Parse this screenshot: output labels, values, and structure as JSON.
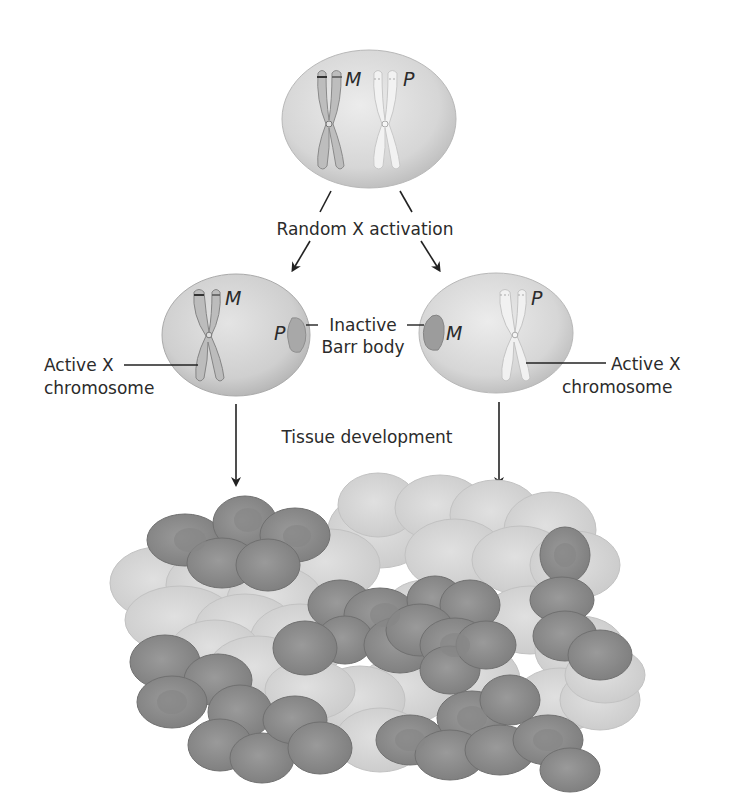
{
  "diagram": {
    "title_step1": "Random X activation",
    "title_step2": "Tissue development",
    "top_cell": {
      "chromosome_maternal": "M",
      "chromosome_paternal": "P"
    },
    "left_cell": {
      "active_label": "M",
      "barr_label": "P",
      "active_callout_line1": "Active X",
      "active_callout_line2": "chromosome"
    },
    "right_cell": {
      "active_label": "P",
      "barr_label": "M",
      "active_callout_line1": "Active X",
      "active_callout_line2": "chromosome"
    },
    "barr_callout_line1": "Inactive",
    "barr_callout_line2": "Barr body"
  },
  "colors": {
    "background": "#ffffff",
    "cell_fill": "#dcdcdc",
    "cell_edge": "#b4b4b4",
    "dark_cell": "#8f8f8f",
    "light_cell": "#d4d4d4",
    "text": "#2b2b2b",
    "arrow": "#222222"
  }
}
